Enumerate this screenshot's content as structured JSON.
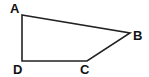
{
  "diagram": {
    "type": "quadrilateral",
    "name": "ABCD",
    "stroke_color": "#222222",
    "background": "#ffffff",
    "vertices": [
      {
        "label": "A",
        "x": 22,
        "y": 15,
        "label_x": 10,
        "label_y": 13
      },
      {
        "label": "B",
        "x": 130,
        "y": 33,
        "label_x": 133,
        "label_y": 40
      },
      {
        "label": "C",
        "x": 87,
        "y": 61,
        "label_x": 80,
        "label_y": 74
      },
      {
        "label": "D",
        "x": 22,
        "y": 61,
        "label_x": 13,
        "label_y": 74
      }
    ],
    "edges": [
      [
        "A",
        "B"
      ],
      [
        "B",
        "C"
      ],
      [
        "C",
        "D"
      ],
      [
        "D",
        "A"
      ]
    ]
  }
}
